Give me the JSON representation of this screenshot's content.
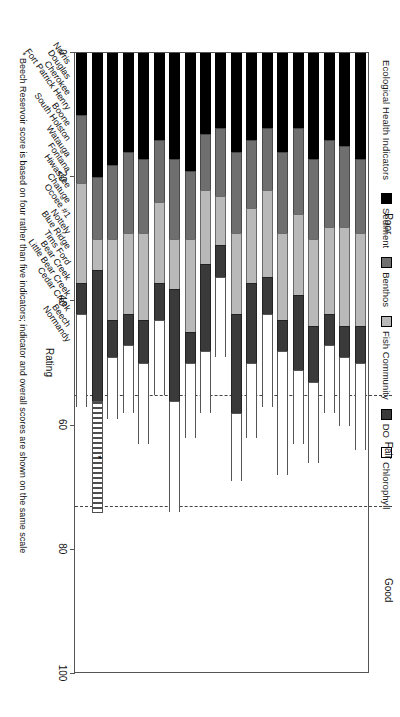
{
  "legend": {
    "title": "Ecological Health Indicators",
    "items": [
      {
        "label": "Sediment",
        "color": "#000000",
        "key": "sediment"
      },
      {
        "label": "Benthos",
        "color": "#6f6f6f",
        "key": "benthos"
      },
      {
        "label": "Fish Community",
        "color": "#b9b9b9",
        "key": "fish"
      },
      {
        "label": "DO",
        "color": "#3a3a3a",
        "key": "do"
      },
      {
        "label": "Chlorophyll",
        "color": "#ffffff",
        "key": "chloro"
      }
    ]
  },
  "zones": [
    {
      "label": "Poor",
      "from": 0,
      "to": 55
    },
    {
      "label": "Fair",
      "from": 55,
      "to": 73
    },
    {
      "label": "Good",
      "from": 73,
      "to": 100
    }
  ],
  "zone_boundaries": [
    55,
    73
  ],
  "axis": {
    "title": "Rating",
    "min": 0,
    "max": 100,
    "ticks": [
      0,
      20,
      40,
      60,
      80,
      100
    ],
    "tick_labels": [
      "0",
      "20",
      "40",
      "60",
      "80",
      "100"
    ]
  },
  "footnote": "* Beech Reservoir score is based on four rather than five indicators; indicator and overall scores are shown on the same scale",
  "chart_data": {
    "type": "bar",
    "title": "",
    "subtitle": "",
    "orientation": "vertical-stacked",
    "stacked": true,
    "xlabel": "",
    "ylabel": "Rating",
    "ylim": [
      0,
      100
    ],
    "grid": false,
    "legend_position": "top-left",
    "categories": [
      "Norris",
      "Douglas",
      "Cherokee",
      "Fort Patrick Henry",
      "Boone",
      "South Holston",
      "Watauga",
      "Fontana",
      "Hiwassee",
      "Chatuge",
      "Ocoee #1",
      "Nottely",
      "Blue Ridge",
      "Tims Ford",
      "Bear Creek",
      "Little Bear Creek",
      "Cedar Creek",
      "Beech",
      "Normandy"
    ],
    "series": [
      {
        "name": "Sediment",
        "key": "sediment",
        "color": "#000000",
        "values": [
          17,
          15,
          14,
          17,
          12,
          16,
          12,
          14,
          16,
          12,
          13,
          19,
          17,
          14,
          17,
          16,
          18,
          20,
          10
        ]
      },
      {
        "name": "Benthos",
        "key": "benthos",
        "color": "#6f6f6f",
        "values": [
          12,
          13,
          14,
          13,
          14,
          13,
          10,
          11,
          13,
          11,
          9,
          11,
          13,
          10,
          12,
          13,
          12,
          10,
          11
        ]
      },
      {
        "name": "Fish Community",
        "key": "fish",
        "color": "#b9b9b9",
        "values": [
          15,
          16,
          14,
          14,
          13,
          14,
          14,
          12,
          13,
          8,
          12,
          15,
          8,
          13,
          14,
          13,
          13,
          5,
          16
        ]
      },
      {
        "name": "DO",
        "key": "do",
        "color": "#3a3a3a",
        "values": [
          6,
          5,
          5,
          9,
          12,
          5,
          6,
          13,
          16,
          5,
          14,
          5,
          18,
          6,
          7,
          5,
          6,
          21,
          5
        ]
      },
      {
        "name": "Chlorophyll",
        "key": "chloro",
        "color": "#ffffff",
        "values": [
          14,
          11,
          11,
          13,
          12,
          20,
          15,
          12,
          11,
          13,
          10,
          12,
          18,
          12,
          13,
          11,
          10,
          0,
          15
        ]
      }
    ],
    "totals": [
      64,
      60,
      58,
      66,
      63,
      68,
      57,
      62,
      69,
      49,
      58,
      62,
      74,
      55,
      63,
      58,
      59,
      56,
      57
    ],
    "beech_extra_segment": {
      "label": "Beech 4-indicator overall",
      "value": 18,
      "pattern": "vertical-stripes",
      "marker": "*"
    }
  }
}
